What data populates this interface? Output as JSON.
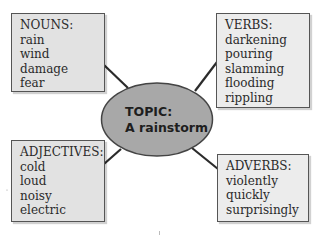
{
  "diagram": {
    "type": "word-web",
    "center": {
      "label": "TOPIC:",
      "value": "A rainstorm",
      "fill": "#a8a8a8",
      "stroke": "#444444"
    },
    "boxes": {
      "nouns": {
        "title": "NOUNS:",
        "words": [
          "rain",
          "wind",
          "damage",
          "fear"
        ]
      },
      "verbs": {
        "title": "VERBS:",
        "words": [
          "darkening",
          "pouring",
          "slamming",
          "flooding",
          "rippling"
        ]
      },
      "adjectives": {
        "title": "ADJECTIVES:",
        "words": [
          "cold",
          "loud",
          "noisy",
          "electric"
        ]
      },
      "adverbs": {
        "title": "ADVERBS:",
        "words": [
          "violently",
          "quickly",
          "surprisingly"
        ]
      }
    },
    "colors": {
      "box_fill": "#e2e2e2",
      "box_border": "#555555",
      "connector": "#2b2b2b"
    }
  }
}
